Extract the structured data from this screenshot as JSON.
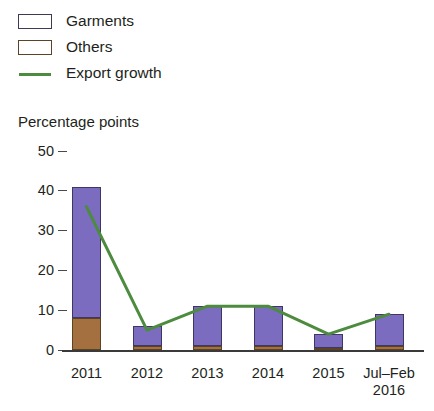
{
  "chart_data": {
    "type": "bar",
    "title": "",
    "ylabel": "Percentage points",
    "xlabel": "",
    "ylim": [
      0,
      50
    ],
    "yticks": [
      0,
      10,
      20,
      30,
      40,
      50
    ],
    "ytick_labels": [
      "0",
      "10",
      "20",
      "30",
      "40",
      "50"
    ],
    "grid": false,
    "legend_position": "top-left",
    "categories": [
      "2011",
      "2012",
      "2013",
      "2014",
      "2015",
      "Jul–Feb 2016"
    ],
    "category_labels": [
      {
        "line1": "2011",
        "line2": ""
      },
      {
        "line1": "2012",
        "line2": ""
      },
      {
        "line1": "2013",
        "line2": ""
      },
      {
        "line1": "2014",
        "line2": ""
      },
      {
        "line1": "2015",
        "line2": ""
      },
      {
        "line1": "Jul–Feb",
        "line2": "2016"
      }
    ],
    "stacked": true,
    "series": [
      {
        "name": "Garments",
        "type": "bar",
        "color": "#7b6cc0",
        "values": [
          33,
          5,
          10,
          10,
          3.5,
          8
        ]
      },
      {
        "name": "Others",
        "type": "bar",
        "color": "#a5703f",
        "values": [
          8,
          1,
          1,
          1,
          0.5,
          1
        ]
      },
      {
        "name": "Export growth",
        "type": "line",
        "color": "#4d8b3f",
        "values": [
          36,
          5,
          11,
          11,
          4,
          9
        ]
      }
    ],
    "stack_totals": [
      41,
      6,
      11,
      11,
      4,
      9
    ]
  },
  "legend": {
    "items": [
      {
        "label": "Garments",
        "marker": "square-swatch-purple"
      },
      {
        "label": "Others",
        "marker": "square-swatch-brown"
      },
      {
        "label": "Export growth",
        "marker": "line-swatch-green"
      }
    ]
  },
  "axis": {
    "y_title": "Percentage points"
  },
  "colors": {
    "garments": "#7b6cc0",
    "others": "#a5703f",
    "export_growth": "#4d8b3f",
    "text": "#231f20",
    "axis": "#3a3a3a",
    "background": "#ffffff"
  }
}
